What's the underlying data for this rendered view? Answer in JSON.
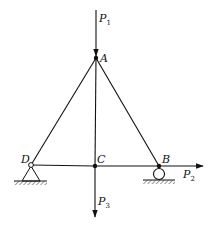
{
  "diagram": {
    "type": "truss",
    "nodes": [
      {
        "id": "A",
        "label": "A",
        "x": 96,
        "y": 58
      },
      {
        "id": "D",
        "label": "D",
        "x": 31,
        "y": 165,
        "support": "pin"
      },
      {
        "id": "C",
        "label": "C",
        "x": 95,
        "y": 166
      },
      {
        "id": "B",
        "label": "B",
        "x": 159,
        "y": 166,
        "support": "roller"
      }
    ],
    "members": [
      {
        "from": "A",
        "to": "D"
      },
      {
        "from": "A",
        "to": "B"
      },
      {
        "from": "A",
        "to": "C"
      },
      {
        "from": "D",
        "to": "C"
      },
      {
        "from": "C",
        "to": "B"
      }
    ],
    "loads": [
      {
        "name": "P",
        "sub": "1",
        "at": "A",
        "direction": "down"
      },
      {
        "name": "P",
        "sub": "2",
        "at": "B",
        "direction": "right"
      },
      {
        "name": "P",
        "sub": "3",
        "at": "C",
        "direction": "down"
      }
    ],
    "labels": {
      "A": "A",
      "B": "B",
      "C": "C",
      "D": "D",
      "P1": "P",
      "P1_sub": "1",
      "P2": "P",
      "P2_sub": "2",
      "P3": "P",
      "P3_sub": "3"
    },
    "colors": {
      "line": "#111111",
      "background": "#ffffff"
    }
  }
}
